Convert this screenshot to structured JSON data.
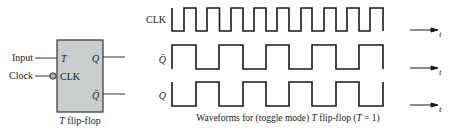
{
  "flipflop": {
    "inputs": [
      {
        "label": "Input",
        "pin": "T"
      },
      {
        "label": "Clock",
        "pin": "CLK",
        "inverted": true
      }
    ],
    "outputs": [
      "Q",
      "Q̄"
    ],
    "caption_italic": "T",
    "caption_rest": " flip-flop",
    "fill_color": "#c9cdcd"
  },
  "waveforms": {
    "signals": [
      {
        "name": "CLK",
        "levels": [
          0,
          1,
          0,
          1,
          0,
          1,
          0,
          1,
          0,
          1,
          0,
          1,
          0,
          1,
          0,
          1,
          0,
          1,
          0
        ]
      },
      {
        "name": "Q̄",
        "levels": [
          1,
          0,
          1,
          0,
          1,
          0,
          1,
          0,
          1,
          0
        ]
      },
      {
        "name": "Q",
        "levels": [
          0,
          1,
          0,
          1,
          0,
          1,
          0,
          1,
          0,
          1
        ]
      }
    ],
    "axis_label": "t",
    "caption_pre": "Waveforms for (toggle mode) ",
    "caption_italic": "T",
    "caption_mid": " flip-flop (",
    "caption_italic2": "T",
    "caption_post": " = 1)"
  }
}
